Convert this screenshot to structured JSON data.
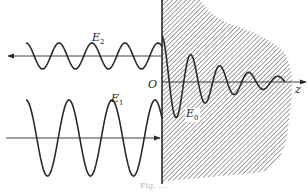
{
  "figure": {
    "labels": {
      "reflected": {
        "letter": "E",
        "sub": "2"
      },
      "incident": {
        "letter": "E",
        "sub": "1"
      },
      "transmitted": {
        "letter": "E",
        "sub": "0"
      },
      "origin": "O",
      "axis": "z"
    },
    "caption": "Fig. ...",
    "colors": {
      "ink": "#2a2a2a",
      "hatch": "#555555",
      "background": "#ffffff"
    },
    "waves": {
      "incident": {
        "direction": "right",
        "center_y": 138,
        "amplitude": 38,
        "period": 43,
        "x_start": 26,
        "x_end": 162
      },
      "reflected": {
        "direction": "left",
        "center_y": 56,
        "amplitude": 13,
        "period": 33,
        "x_start": 26,
        "x_end": 162
      },
      "transmitted": {
        "direction": "right",
        "center_y": 82,
        "amplitude": 46,
        "period": 29,
        "decay": 0.018,
        "x_start": 162,
        "x_end": 285
      }
    }
  }
}
